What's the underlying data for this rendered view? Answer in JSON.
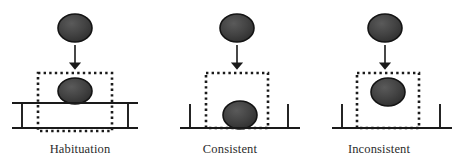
{
  "figure": {
    "width": 458,
    "height": 165,
    "background": "#ffffff",
    "ink_color": "#1a1a1a",
    "ball_fill": "#3d3d3d",
    "ball_stroke": "#141414",
    "dotted_color": "#1a1a1a"
  },
  "panels": [
    {
      "id": "habituation",
      "label": "Habituation",
      "support_type": "table",
      "ball_state": "resting-on-table-top",
      "falling_ball": {
        "cx": 75,
        "cy": 28,
        "rx": 17,
        "ry": 14
      },
      "arrow": {
        "x": 75,
        "y_start": 45,
        "y_end": 69
      },
      "occluder_box": {
        "x": 38,
        "y": 73,
        "width": 74,
        "height": 58
      },
      "resting_ball": {
        "cx": 75,
        "cy": 91,
        "rx": 17,
        "ry": 13
      },
      "table": {
        "top_line": {
          "x1": 12,
          "y1": 103,
          "x2": 138,
          "y2": 103
        },
        "bottom_line": {
          "x1": 12,
          "y1": 128,
          "x2": 138,
          "y2": 128
        },
        "left_post": {
          "x": 22,
          "y1": 103,
          "y2": 128
        },
        "right_post": {
          "x": 128,
          "y1": 103,
          "y2": 128
        }
      }
    },
    {
      "id": "consistent",
      "label": "Consistent",
      "support_type": "ground-with-posts",
      "ball_state": "resting-on-ground",
      "falling_ball": {
        "cx": 237,
        "cy": 28,
        "rx": 17,
        "ry": 14
      },
      "arrow": {
        "x": 237,
        "y_start": 45,
        "y_end": 69
      },
      "occluder_box": {
        "x": 206,
        "y": 73,
        "width": 62,
        "height": 55
      },
      "resting_ball": {
        "cx": 240,
        "cy": 115,
        "rx": 17,
        "ry": 14
      },
      "ground": {
        "line": {
          "x1": 180,
          "y1": 128,
          "x2": 300,
          "y2": 128
        },
        "left_post": {
          "x": 190,
          "y1": 104,
          "y2": 128
        },
        "right_post": {
          "x": 288,
          "y1": 104,
          "y2": 128
        }
      }
    },
    {
      "id": "inconsistent",
      "label": "Inconsistent",
      "support_type": "ground-with-posts",
      "ball_state": "floating-in-midair",
      "falling_ball": {
        "cx": 385,
        "cy": 28,
        "rx": 17,
        "ry": 14
      },
      "arrow": {
        "x": 385,
        "y_start": 45,
        "y_end": 69
      },
      "occluder_box": {
        "x": 357,
        "y": 73,
        "width": 62,
        "height": 55
      },
      "resting_ball": {
        "cx": 388,
        "cy": 92,
        "rx": 17,
        "ry": 14
      },
      "ground": {
        "line": {
          "x1": 332,
          "y1": 128,
          "x2": 452,
          "y2": 128
        },
        "left_post": {
          "x": 342,
          "y1": 104,
          "y2": 128
        },
        "right_post": {
          "x": 440,
          "y1": 104,
          "y2": 128
        }
      }
    }
  ]
}
